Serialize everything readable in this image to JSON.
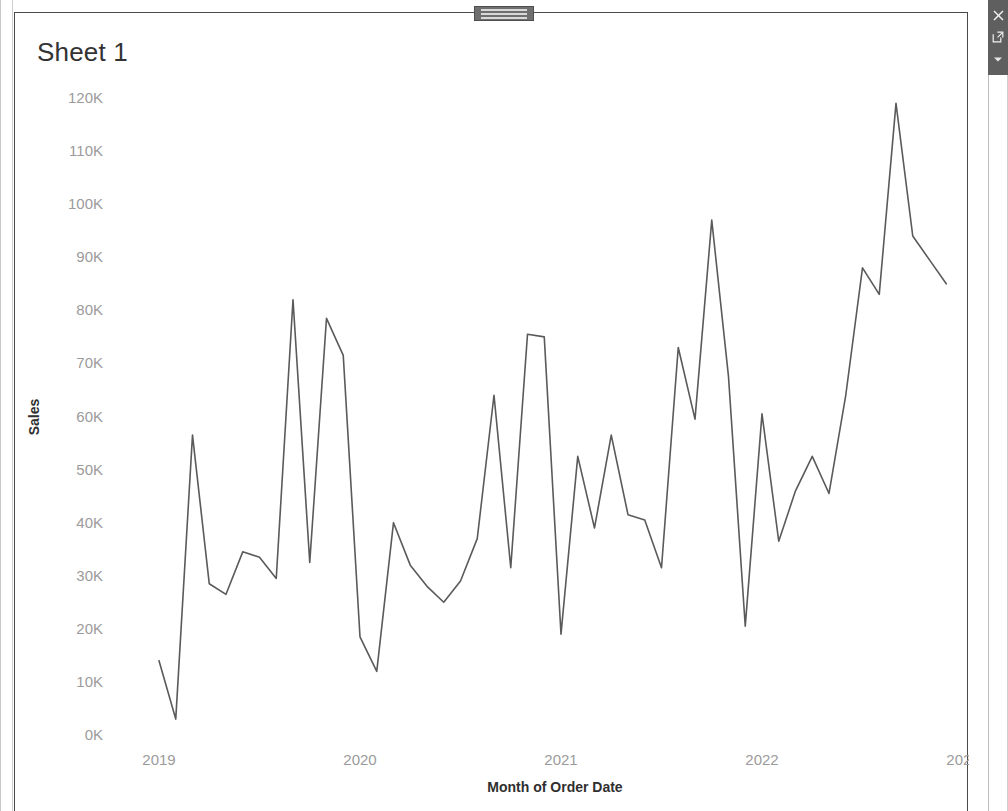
{
  "window": {
    "title": "Sheet 1",
    "drag_handle_name": "panel-drag-handle"
  },
  "right_toolbar": {
    "close_label": "×",
    "popout_label": "↗",
    "more_label": "▾",
    "background_color": "#5f5f5f"
  },
  "chart_data": {
    "type": "line",
    "title": "Sheet 1",
    "xlabel": "Month of Order Date",
    "ylabel": "Sales",
    "line_color": "#5a5a5a",
    "grid": false,
    "legend": "none",
    "ylim": [
      0,
      125000
    ],
    "y_ticks": [
      0,
      10000,
      20000,
      30000,
      40000,
      50000,
      60000,
      70000,
      80000,
      90000,
      100000,
      110000,
      120000
    ],
    "y_tick_labels": [
      "0K",
      "10K",
      "20K",
      "30K",
      "40K",
      "50K",
      "60K",
      "70K",
      "80K",
      "90K",
      "100K",
      "110K",
      "120K"
    ],
    "x_tick_labels": [
      "2019",
      "2020",
      "2021",
      "2022",
      "2023"
    ],
    "x_tick_values": [
      "2019-01",
      "2020-01",
      "2021-01",
      "2022-01",
      "2023-01"
    ],
    "x": [
      "2019-01",
      "2019-02",
      "2019-03",
      "2019-04",
      "2019-05",
      "2019-06",
      "2019-07",
      "2019-08",
      "2019-09",
      "2019-10",
      "2019-11",
      "2019-12",
      "2020-01",
      "2020-02",
      "2020-03",
      "2020-04",
      "2020-05",
      "2020-06",
      "2020-07",
      "2020-08",
      "2020-09",
      "2020-10",
      "2020-11",
      "2020-12",
      "2021-01",
      "2021-02",
      "2021-03",
      "2021-04",
      "2021-05",
      "2021-06",
      "2021-07",
      "2021-08",
      "2021-09",
      "2021-10",
      "2021-11",
      "2021-12",
      "2022-01",
      "2022-02",
      "2022-03",
      "2022-04",
      "2022-05",
      "2022-06",
      "2022-07",
      "2022-08",
      "2022-09",
      "2022-10",
      "2022-11",
      "2022-12"
    ],
    "values": [
      14000,
      3000,
      56500,
      28500,
      26500,
      34500,
      33500,
      29500,
      82000,
      32500,
      78500,
      71500,
      18500,
      12000,
      40000,
      32000,
      28000,
      25000,
      29000,
      37000,
      64000,
      31500,
      75500,
      75000,
      19000,
      52500,
      39000,
      56500,
      41500,
      40500,
      31500,
      73000,
      59500,
      97000,
      67500,
      20500,
      60500,
      36500,
      46000,
      52500,
      45500,
      64000,
      88000,
      83000,
      119000,
      94000,
      89500,
      85000
    ],
    "series_name": "Sales"
  }
}
